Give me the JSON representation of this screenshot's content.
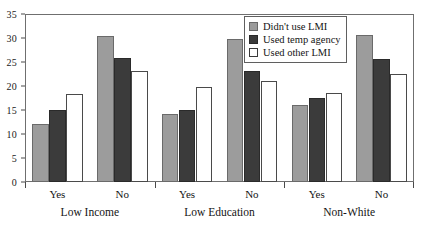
{
  "chart_data": {
    "type": "bar",
    "title": "",
    "xlabel": "",
    "ylabel": "",
    "ylim": [
      0,
      35
    ],
    "yticks": [
      0,
      5,
      10,
      15,
      20,
      25,
      30,
      35
    ],
    "grid": false,
    "legend_position": "top-right",
    "groups": [
      {
        "label": "Low Income",
        "subgroups": [
          {
            "label": "Yes",
            "values": [
              12.0,
              15.1,
              18.4
            ]
          },
          {
            "label": "No",
            "values": [
              30.4,
              25.8,
              23.2
            ]
          }
        ]
      },
      {
        "label": "Low Education",
        "subgroups": [
          {
            "label": "Yes",
            "values": [
              14.1,
              15.0,
              19.8
            ]
          },
          {
            "label": "No",
            "values": [
              29.8,
              23.2,
              21.0
            ]
          }
        ]
      },
      {
        "label": "Non-White",
        "subgroups": [
          {
            "label": "Yes",
            "values": [
              16.0,
              17.4,
              18.5
            ]
          },
          {
            "label": "No",
            "values": [
              30.7,
              25.7,
              22.5
            ]
          }
        ]
      }
    ],
    "series": [
      {
        "name": "Didn't use LMI",
        "color": "#9c9c9c",
        "values": [
          12.0,
          30.4,
          14.1,
          29.8,
          16.0,
          30.7
        ]
      },
      {
        "name": "Used temp agency",
        "color": "#3b3b3b",
        "values": [
          15.1,
          25.8,
          15.0,
          23.2,
          17.4,
          25.7
        ]
      },
      {
        "name": "Used other LMI",
        "color": "#ffffff",
        "values": [
          18.4,
          23.2,
          19.8,
          21.0,
          18.5,
          22.5
        ]
      }
    ],
    "categories": [
      "Low Income - Yes",
      "Low Income - No",
      "Low Education - Yes",
      "Low Education - No",
      "Non-White - Yes",
      "Non-White - No"
    ]
  },
  "legend": {
    "items": [
      {
        "label": "Didn't use LMI"
      },
      {
        "label": "Used temp agency"
      },
      {
        "label": "Used other LMI"
      }
    ]
  }
}
